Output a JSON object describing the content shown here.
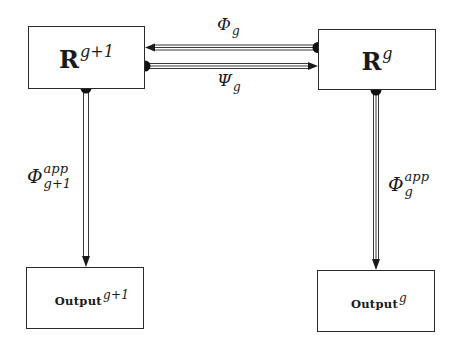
{
  "diagram": {
    "nodes": {
      "r_next": {
        "base": "R",
        "superscript": "g+1"
      },
      "r_cur": {
        "base": "R",
        "superscript": "g"
      },
      "output_next": {
        "base": "Output",
        "superscript": "g+1"
      },
      "output_cur": {
        "base": "Output",
        "superscript": "g"
      }
    },
    "edges": {
      "phi_g": {
        "from": "R^g",
        "to": "R^{g+1}",
        "symbol": "Φ",
        "subscript": "g"
      },
      "psi_g": {
        "from": "R^{g+1}",
        "to": "R^g",
        "symbol": "Ψ",
        "subscript": "g"
      },
      "phi_app_next": {
        "from": "R^{g+1}",
        "to": "Output^{g+1}",
        "symbol": "Φ",
        "superscript": "app",
        "subscript": "g+1"
      },
      "phi_app_cur": {
        "from": "R^g",
        "to": "Output^g",
        "symbol": "Φ",
        "superscript": "app",
        "subscript": "g"
      }
    },
    "colors": {
      "line": "#2a2a2a",
      "dot": "#111111",
      "background": "#ffffff"
    }
  }
}
